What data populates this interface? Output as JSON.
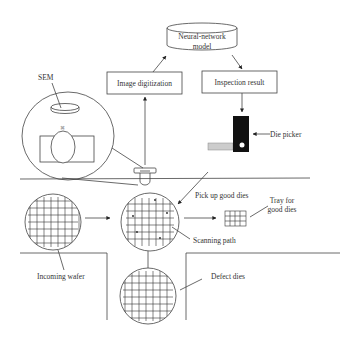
{
  "diagram": {
    "nodes": {
      "neural_network": {
        "line1": "Neural-network",
        "line2": "model"
      },
      "image_digitization": "Image digitization",
      "inspection_result": "Inspection result",
      "sem": "SEM",
      "die_picker": "Die picker",
      "pick_up": "Pick up good dies",
      "tray_line1": "Tray for",
      "tray_line2": "good dies",
      "scanning_path": "Scanning path",
      "incoming_wafer": "Incoming wafer",
      "defect_dies": "Defect dies"
    },
    "colors": {
      "line": "#444444",
      "picker": "#111111",
      "background": "#ffffff"
    }
  }
}
